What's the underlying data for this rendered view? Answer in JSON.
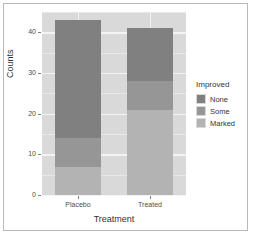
{
  "chart_data": {
    "type": "bar",
    "title": "",
    "xlabel": "Treatment",
    "ylabel": "Counts",
    "categories": [
      "Placebo",
      "Treated"
    ],
    "series": [
      {
        "name": "None",
        "values": [
          29,
          13
        ],
        "color": "#808080"
      },
      {
        "name": "Some",
        "values": [
          7,
          7
        ],
        "color": "#969696"
      },
      {
        "name": "Marked",
        "values": [
          7,
          21
        ],
        "color": "#b3b3b3"
      }
    ],
    "stacked": true,
    "totals": [
      43,
      41
    ],
    "ylim": [
      0,
      45
    ],
    "yticks": [
      0,
      10,
      20,
      30,
      40
    ],
    "ytick_labels": [
      "0",
      "10",
      "20",
      "30",
      "40"
    ],
    "xtick_labels": [
      "Placebo",
      "Treated"
    ],
    "grid": true,
    "legend": {
      "title": "Improved",
      "position": "right",
      "entries": [
        "None",
        "Some",
        "Marked"
      ]
    },
    "panel_background": "#d9d9d9",
    "grid_color": "#f4f4f4",
    "figure_background": "#ffffff"
  },
  "axes": {
    "y": {
      "label": "Counts",
      "ticks": [
        {
          "label": "40"
        },
        {
          "label": "30"
        },
        {
          "label": "20"
        },
        {
          "label": "10"
        },
        {
          "label": "0"
        }
      ]
    },
    "x": {
      "label": "Treatment",
      "ticks": [
        {
          "label": "Placebo"
        },
        {
          "label": "Treated"
        }
      ]
    }
  },
  "legend": {
    "title": "Improved",
    "items": [
      {
        "label": "None"
      },
      {
        "label": "Some"
      },
      {
        "label": "Marked"
      }
    ]
  }
}
